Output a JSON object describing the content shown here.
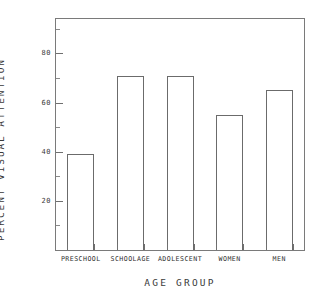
{
  "chart_data": {
    "type": "bar",
    "title": "",
    "xlabel": "AGE GROUP",
    "ylabel": "PERCENT VISUAL ATTENTION",
    "categories": [
      "PRESCHOOL",
      "SCHOOLAGE",
      "ADOLESCENT",
      "WOMEN",
      "MEN"
    ],
    "values": [
      39,
      71,
      71,
      55,
      65
    ],
    "ylim": [
      0,
      94
    ],
    "yticks": [
      20,
      40,
      60,
      80
    ],
    "ytick_labels": [
      "20",
      "40",
      "60",
      "80"
    ],
    "yminorticks": [
      10,
      30,
      50,
      70,
      90
    ],
    "grid": false,
    "legend": false,
    "bar_style": {
      "fill": "#ffffff",
      "edge": "#6b6b6b"
    },
    "frame_color": "#7a7a7a",
    "background": "#ffffff"
  },
  "axes": {
    "y_title": "PERCENT VISUAL ATTENTION",
    "x_title": "AGE GROUP"
  }
}
